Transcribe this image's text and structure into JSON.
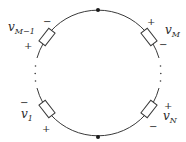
{
  "diagram": {
    "type": "circuit-loop",
    "colors": {
      "wire": "#3a3a3a",
      "text": "#2a2a2a",
      "background": "#ffffff"
    },
    "nodes": [
      {
        "id": "top-node",
        "position": "top"
      },
      {
        "id": "bottom-node",
        "position": "bottom"
      }
    ],
    "elements": [
      {
        "id": "vM-1",
        "label": "v",
        "subscript": "M−1",
        "top_sign": "−",
        "bottom_sign": "+"
      },
      {
        "id": "vM",
        "label": "v",
        "subscript": "M",
        "top_sign": "+",
        "bottom_sign": "−"
      },
      {
        "id": "v1",
        "label": "v",
        "subscript": "1",
        "top_sign": "−",
        "bottom_sign": "+"
      },
      {
        "id": "vN",
        "label": "v",
        "subscript": "N",
        "top_sign": "+",
        "bottom_sign": "−"
      }
    ],
    "ellipsis_left": "⋮",
    "ellipsis_right": "⋮"
  }
}
